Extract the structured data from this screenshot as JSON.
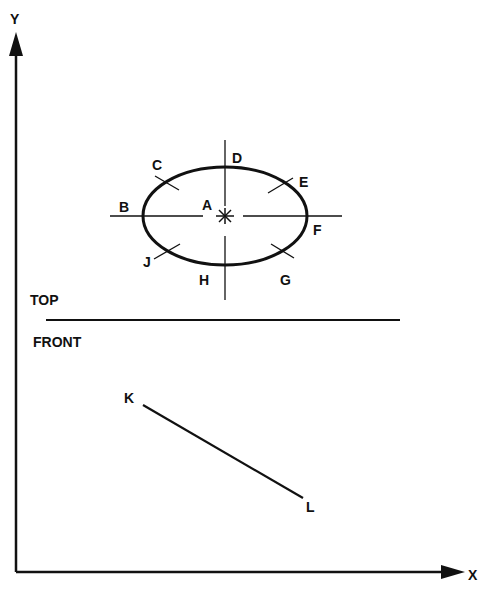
{
  "axes": {
    "y_label": "Y",
    "x_label": "X"
  },
  "views": {
    "top_label": "TOP",
    "front_label": "FRONT"
  },
  "points": {
    "A": "A",
    "B": "B",
    "C": "C",
    "D": "D",
    "E": "E",
    "F": "F",
    "G": "G",
    "H": "H",
    "J": "J",
    "K": "K",
    "L": "L"
  },
  "colors": {
    "ink": "#111111",
    "background": "#ffffff"
  }
}
